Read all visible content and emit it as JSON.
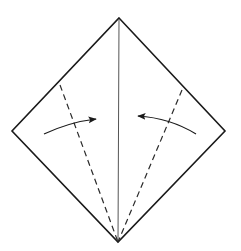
{
  "diagram": {
    "type": "origami-fold-instruction",
    "colors": {
      "background": "#ffffff",
      "outline": "#1a1a1a",
      "crease": "#555555",
      "fold_line": "#2a2a2a",
      "arrow": "#1a1a1a"
    },
    "shape": {
      "top": [
        119,
        18
      ],
      "right": [
        225,
        131
      ],
      "bottom": [
        118,
        242
      ],
      "left": [
        12,
        131
      ]
    },
    "center_crease": {
      "from": [
        119,
        19
      ],
      "to": [
        118,
        241
      ]
    },
    "valley_folds": [
      {
        "name": "left",
        "from": [
          60,
          85
        ],
        "to": [
          118,
          242
        ]
      },
      {
        "name": "right",
        "from": [
          182,
          90
        ],
        "to": [
          118,
          242
        ]
      }
    ],
    "arrows": [
      {
        "name": "left",
        "direction": "right",
        "path": "M 44 134 Q 70 122 96 119"
      },
      {
        "name": "right",
        "direction": "left",
        "path": "M 196 134 Q 170 118 138 116"
      }
    ]
  }
}
